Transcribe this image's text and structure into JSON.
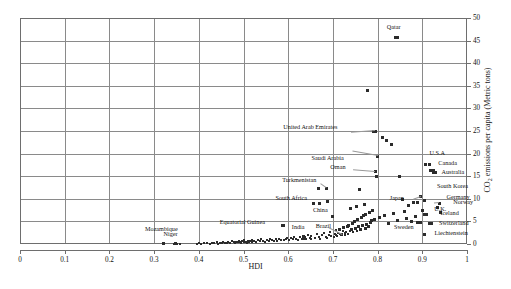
{
  "chart": {
    "type": "scatter",
    "title": "",
    "xlabel": "HDI",
    "ylabel_html": "CO2 emissions per capita (Metric tons)",
    "ylabel_main": "CO",
    "ylabel_sub": "2",
    "ylabel_rest": " emissions per capita (Metric tons)",
    "xlim": [
      0,
      1
    ],
    "ylim": [
      0,
      50
    ],
    "x_ticks": [
      "0",
      "0.1",
      "0.2",
      "0.3",
      "0.4",
      "0.5",
      "0.6",
      "0.7",
      "0.8",
      "0.9",
      "1"
    ],
    "x_tick_values": [
      0,
      0.1,
      0.2,
      0.3,
      0.4,
      0.5,
      0.6,
      0.7,
      0.8,
      0.9,
      1
    ],
    "y_ticks": [
      "0",
      "5",
      "10",
      "15",
      "20",
      "25",
      "30",
      "35",
      "40",
      "45",
      "50"
    ],
    "y_tick_values": [
      0,
      5,
      10,
      15,
      20,
      25,
      30,
      35,
      40,
      45,
      50
    ],
    "y_axis_side": "right",
    "grid": true,
    "marker_color": "#2b2b2b",
    "grid_color": "#8a8a8a",
    "axis_color": "#6e6e6e"
  },
  "chart_data": {
    "type": "scatter",
    "title": "",
    "xlabel": "HDI",
    "ylabel": "CO2 emissions per capita (Metric tons)",
    "xlim": [
      0,
      1
    ],
    "ylim": [
      0,
      50
    ],
    "grid": true,
    "legend": "none",
    "labeled_points": [
      {
        "label": "Qatar",
        "x": 0.845,
        "y": 45.6
      },
      {
        "label": "United Arab Emirates",
        "x": 0.795,
        "y": 25.0
      },
      {
        "label": "Saudi Arabia",
        "x": 0.8,
        "y": 19.4
      },
      {
        "label": "Oman",
        "x": 0.795,
        "y": 16.0
      },
      {
        "label": "U.S.A",
        "x": 0.907,
        "y": 17.5
      },
      {
        "label": "Canada",
        "x": 0.918,
        "y": 16.3
      },
      {
        "label": "Australia",
        "x": 0.925,
        "y": 15.8
      },
      {
        "label": "South Korea",
        "x": 0.897,
        "y": 10.5
      },
      {
        "label": "Germany",
        "x": 0.905,
        "y": 9.6
      },
      {
        "label": "Norway",
        "x": 0.938,
        "y": 9.0
      },
      {
        "label": "U.K.",
        "x": 0.9,
        "y": 7.5
      },
      {
        "label": "Iceland",
        "x": 0.905,
        "y": 6.6
      },
      {
        "label": "Switzerland",
        "x": 0.915,
        "y": 4.5
      },
      {
        "label": "Liechtenstein",
        "x": 0.905,
        "y": 2.2
      },
      {
        "label": "Sweden",
        "x": 0.895,
        "y": 4.8
      },
      {
        "label": "Japan",
        "x": 0.89,
        "y": 9.2
      },
      {
        "label": "China",
        "x": 0.7,
        "y": 6.0
      },
      {
        "label": "Turkmenistan",
        "x": 0.685,
        "y": 12.3
      },
      {
        "label": "South Africa",
        "x": 0.67,
        "y": 9.0
      },
      {
        "label": "Brazil",
        "x": 0.72,
        "y": 2.1
      },
      {
        "label": "India",
        "x": 0.635,
        "y": 1.6
      },
      {
        "label": "Equatorial Guinea",
        "x": 0.59,
        "y": 4.2
      },
      {
        "label": "Mozambique",
        "x": 0.32,
        "y": 0.1
      },
      {
        "label": "Niger",
        "x": 0.348,
        "y": 0.1
      }
    ],
    "x": [
      0.345,
      0.35,
      0.352,
      0.358,
      0.395,
      0.4,
      0.405,
      0.412,
      0.418,
      0.424,
      0.43,
      0.435,
      0.44,
      0.444,
      0.448,
      0.452,
      0.455,
      0.458,
      0.462,
      0.466,
      0.47,
      0.474,
      0.478,
      0.48,
      0.484,
      0.487,
      0.49,
      0.492,
      0.495,
      0.497,
      0.5,
      0.502,
      0.505,
      0.508,
      0.51,
      0.512,
      0.515,
      0.518,
      0.52,
      0.524,
      0.528,
      0.532,
      0.536,
      0.54,
      0.544,
      0.548,
      0.552,
      0.556,
      0.56,
      0.564,
      0.568,
      0.572,
      0.576,
      0.58,
      0.584,
      0.588,
      0.59,
      0.594,
      0.598,
      0.602,
      0.606,
      0.61,
      0.614,
      0.618,
      0.622,
      0.626,
      0.63,
      0.632,
      0.634,
      0.636,
      0.638,
      0.64,
      0.644,
      0.648,
      0.65,
      0.652,
      0.656,
      0.66,
      0.664,
      0.668,
      0.67,
      0.672,
      0.676,
      0.68,
      0.684,
      0.686,
      0.688,
      0.692,
      0.694,
      0.696,
      0.7,
      0.702,
      0.704,
      0.706,
      0.708,
      0.71,
      0.712,
      0.714,
      0.716,
      0.718,
      0.72,
      0.722,
      0.724,
      0.726,
      0.728,
      0.73,
      0.732,
      0.734,
      0.736,
      0.738,
      0.74,
      0.742,
      0.744,
      0.746,
      0.748,
      0.75,
      0.752,
      0.754,
      0.756,
      0.758,
      0.76,
      0.762,
      0.764,
      0.766,
      0.768,
      0.77,
      0.772,
      0.774,
      0.776,
      0.778,
      0.78,
      0.782,
      0.784,
      0.786,
      0.788,
      0.79,
      0.792,
      0.795,
      0.798,
      0.8,
      0.805,
      0.81,
      0.815,
      0.82,
      0.825,
      0.83,
      0.835,
      0.84,
      0.845,
      0.85,
      0.855,
      0.86,
      0.865,
      0.87,
      0.875,
      0.88,
      0.885,
      0.89,
      0.895,
      0.9,
      0.905,
      0.91,
      0.915,
      0.92,
      0.925,
      0.93,
      0.935,
      0.94
    ],
    "y": [
      0.1,
      0.1,
      0.1,
      0.1,
      0.1,
      0.2,
      0.1,
      0.3,
      0.2,
      0.1,
      0.3,
      0.2,
      0.4,
      0.1,
      0.3,
      0.2,
      0.5,
      0.3,
      0.2,
      0.4,
      0.3,
      0.6,
      0.4,
      0.3,
      0.5,
      0.4,
      0.7,
      0.5,
      0.3,
      0.6,
      0.4,
      0.8,
      0.5,
      0.3,
      0.7,
      0.4,
      0.6,
      0.9,
      0.5,
      0.7,
      0.4,
      0.8,
      0.6,
      1.0,
      0.7,
      0.5,
      0.9,
      0.6,
      1.1,
      0.8,
      0.6,
      1.0,
      0.7,
      1.2,
      0.9,
      4.2,
      0.8,
      1.1,
      1.4,
      0.9,
      1.3,
      1.0,
      1.6,
      1.2,
      0.9,
      1.5,
      1.1,
      1.8,
      1.3,
      1.0,
      1.6,
      1.2,
      2.0,
      1.4,
      1.1,
      1.7,
      9.0,
      1.3,
      2.2,
      12.3,
      1.5,
      1.2,
      1.9,
      2.4,
      1.6,
      1.3,
      9.3,
      2.1,
      2.7,
      1.8,
      6.0,
      1.5,
      2.3,
      3.0,
      2.0,
      1.7,
      2.5,
      3.3,
      2.2,
      1.9,
      2.1,
      2.8,
      3.6,
      2.4,
      2.0,
      2.6,
      3.9,
      2.3,
      4.2,
      2.9,
      7.8,
      3.2,
      4.6,
      2.6,
      5.0,
      3.5,
      8.2,
      2.9,
      5.4,
      3.8,
      12.0,
      3.2,
      5.8,
      4.1,
      6.2,
      8.8,
      3.5,
      6.6,
      4.4,
      34.0,
      3.8,
      7.0,
      4.7,
      5.1,
      7.4,
      25.0,
      5.5,
      16.0,
      15.0,
      19.4,
      5.9,
      23.5,
      6.3,
      23.0,
      4.5,
      22.0,
      6.7,
      45.6,
      5.2,
      15.0,
      9.8,
      7.1,
      5.6,
      8.5,
      4.9,
      9.2,
      6.0,
      4.8,
      10.5,
      7.5,
      9.6,
      6.6,
      17.5,
      4.5,
      16.3,
      15.8,
      8.0,
      6.9,
      9.0
    ]
  }
}
